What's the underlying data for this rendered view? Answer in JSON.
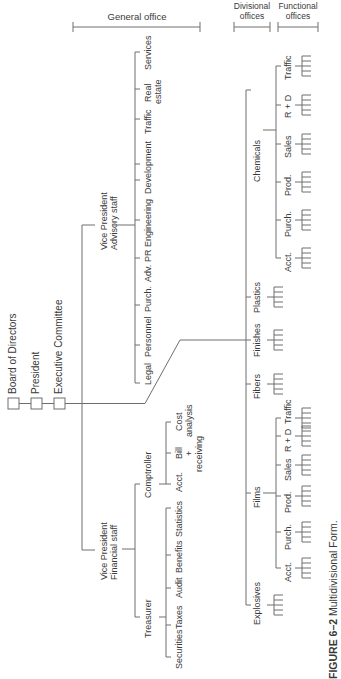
{
  "headers": {
    "general_office": "General office",
    "divisional_offices": [
      "Divisional",
      "offices"
    ],
    "functional_offices": [
      "Functional",
      "offices"
    ]
  },
  "top": {
    "board": "Board of Directors",
    "president": "President",
    "executive": "Executive Committee"
  },
  "advisory": {
    "vp": [
      "Vice President",
      "Advisory staff"
    ],
    "items": [
      {
        "label": [
          "Legal"
        ]
      },
      {
        "label": [
          "Personnel"
        ]
      },
      {
        "label": [
          "Purch."
        ]
      },
      {
        "label": [
          "Adv."
        ]
      },
      {
        "label": [
          "PR"
        ]
      },
      {
        "label": [
          "Engineering"
        ]
      },
      {
        "label": [
          "Development"
        ]
      },
      {
        "label": [
          "Traffic"
        ]
      },
      {
        "label": [
          "Real",
          "estate"
        ]
      },
      {
        "label": [
          "Services"
        ]
      }
    ]
  },
  "financial": {
    "vp": [
      "Vice President",
      "Financial staff"
    ],
    "treasurer": {
      "label": "Treasurer",
      "items": [
        "Securities",
        "Taxes",
        "Audit",
        "Benefits",
        "Statistics"
      ]
    },
    "comptroller": {
      "label": "Comptroller",
      "items": [
        [
          "Acct."
        ],
        [
          "Bill",
          "+",
          "receiving"
        ],
        [
          "Cost",
          "analysis"
        ]
      ]
    }
  },
  "divisions": [
    {
      "name": "Explosives",
      "functions": []
    },
    {
      "name": "Films",
      "functions": [
        "Acct.",
        "Purch.",
        "Prod.",
        "Sales",
        "R + D",
        "Traffic"
      ]
    },
    {
      "name": "Fibers",
      "functions": []
    },
    {
      "name": "Finishes",
      "functions": []
    },
    {
      "name": "Plastics",
      "functions": []
    },
    {
      "name": "Chemicals",
      "functions": [
        "Acct.",
        "Purch.",
        "Prod.",
        "Sales",
        "R + D",
        "Traffic"
      ]
    }
  ],
  "caption": {
    "figure_label": "FIGURE 6–2",
    "title": "Multidivisional Form."
  }
}
